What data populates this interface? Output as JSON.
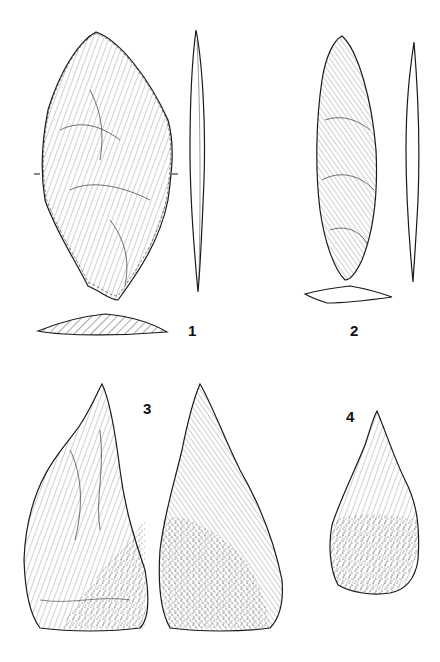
{
  "plate": {
    "background": "#ffffff",
    "ink": "#1a1a1a",
    "figures": [
      {
        "id": 1,
        "label": "1",
        "description": "leaf-shaped biface, face view with side profile and hatched cross-section"
      },
      {
        "id": 2,
        "label": "2",
        "description": "elongated leaf point, face view with side profile and cross-section"
      },
      {
        "id": 3,
        "label": "3",
        "description": "pointed handaxe, two faces (front and back)"
      },
      {
        "id": 4,
        "label": "4",
        "description": "small pointed handaxe, one face"
      }
    ]
  }
}
